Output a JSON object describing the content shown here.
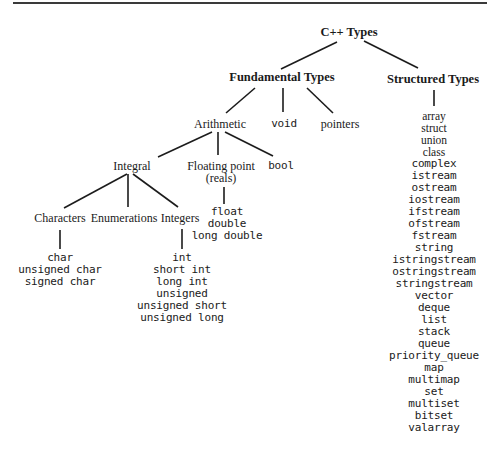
{
  "diagram": {
    "root": "C++ Types",
    "fundamental": {
      "label": "Fundamental Types",
      "arithmetic": {
        "label": "Arithmetic",
        "integral": {
          "label": "Integral",
          "characters": {
            "label": "Characters",
            "items": [
              "char",
              "unsigned char",
              "signed char"
            ]
          },
          "enumerations": {
            "label": "Enumerations"
          },
          "integers": {
            "label": "Integers",
            "items": [
              "int",
              "short int",
              "long int",
              "unsigned",
              "unsigned short",
              "unsigned long"
            ]
          }
        },
        "floating": {
          "label_line1": "Floating point",
          "label_line2": "(reals)",
          "items": [
            "float",
            "double",
            "long double"
          ]
        },
        "bool": "bool"
      },
      "void": "void",
      "pointers": "pointers"
    },
    "structured": {
      "label": "Structured Types",
      "items": [
        "array",
        "struct",
        "union",
        "class",
        "complex",
        "istream",
        "ostream",
        "iostream",
        "ifstream",
        "ofstream",
        "fstream",
        "string",
        "istringstream",
        "ostringstream",
        "stringstream",
        "vector",
        "deque",
        "list",
        "stack",
        "queue",
        "priority_queue",
        "map",
        "multimap",
        "set",
        "multiset",
        "bitset",
        "valarray"
      ]
    }
  }
}
